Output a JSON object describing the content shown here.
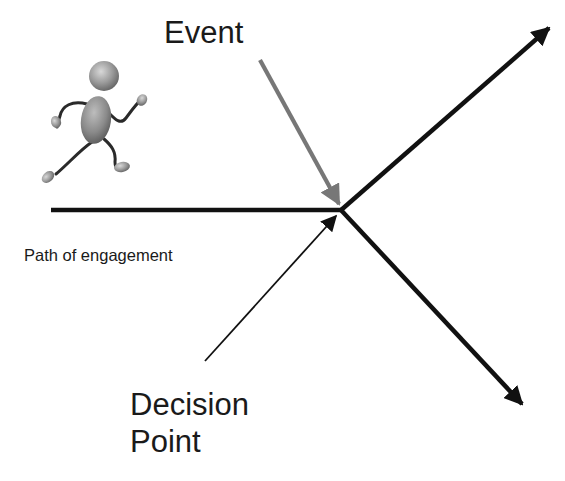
{
  "diagram": {
    "labels": {
      "event": "Event",
      "path_of_engagement": "Path of engagement",
      "decision_point_line1": "Decision",
      "decision_point_line2": "Point"
    },
    "figure": {
      "icon": "running-person-icon",
      "description": "3D gray figure running toward the right"
    },
    "colors": {
      "path_lines": "#111111",
      "event_arrow": "#777777",
      "decision_arrow": "#111111",
      "text": "#1a1a1a",
      "background": "#ffffff"
    }
  }
}
